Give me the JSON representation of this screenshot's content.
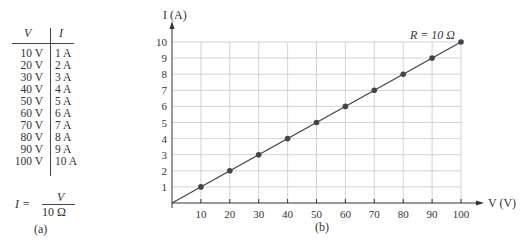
{
  "table": {
    "headers": {
      "v": "V",
      "i": "I"
    },
    "rows": [
      {
        "v": "10 V",
        "i": "1 A"
      },
      {
        "v": "20 V",
        "i": "2 A"
      },
      {
        "v": "30 V",
        "i": "3 A"
      },
      {
        "v": "40 V",
        "i": "4 A"
      },
      {
        "v": "50 V",
        "i": "5 A"
      },
      {
        "v": "60 V",
        "i": "6 A"
      },
      {
        "v": "70 V",
        "i": "7 A"
      },
      {
        "v": "80 V",
        "i": "8 A"
      },
      {
        "v": "90 V",
        "i": "9 A"
      },
      {
        "v": "100 V",
        "i": "10 A"
      }
    ],
    "formula": {
      "lhs": "I =",
      "numerator": "V",
      "denominator": "10 Ω"
    },
    "label": "(a)"
  },
  "graph": {
    "label": "(b)",
    "annotation": "R = 10 Ω"
  },
  "colors": {
    "ink": "#333333",
    "grid": "#c8c8c8",
    "line": "#444444",
    "marker": "#444444"
  },
  "chart_data": {
    "type": "line",
    "title": "",
    "xlabel": "V (V)",
    "ylabel": "I (A)",
    "x": [
      10,
      20,
      30,
      40,
      50,
      60,
      70,
      80,
      90,
      100
    ],
    "series": [
      {
        "name": "R = 10 Ω",
        "values": [
          1,
          2,
          3,
          4,
          5,
          6,
          7,
          8,
          9,
          10
        ]
      }
    ],
    "xticks": [
      10,
      20,
      30,
      40,
      50,
      60,
      70,
      80,
      90,
      100
    ],
    "yticks": [
      1,
      2,
      3,
      4,
      5,
      6,
      7,
      8,
      9,
      10
    ],
    "xlim": [
      0,
      100
    ],
    "ylim": [
      0,
      10
    ],
    "grid": true,
    "legend": "none",
    "annotations": [
      "R = 10 Ω"
    ],
    "line_from_origin": true
  }
}
